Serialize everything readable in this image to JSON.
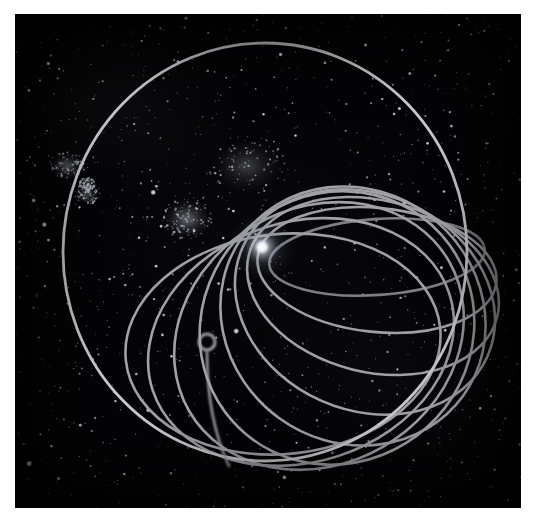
{
  "figure": {
    "caption": "",
    "kind": "astronomical-orbit-diagram",
    "plate": {
      "background_color": "#040406",
      "left": 15,
      "top": 14,
      "width": 506,
      "height": 494,
      "page_background": "#ffffff"
    }
  },
  "style": {
    "orbit_stroke_color": "#a0a2a6",
    "orbit_stroke_color_bright": "#c9cbce",
    "orbit_stroke_color_dim": "#7d7f84",
    "orbit_stroke_width": 2.6,
    "outer_orbit_stroke_width": 2.8,
    "star_core_color": "#ffffff",
    "star_glow_color": "#dfe4ef",
    "star_halo_color": "#8f98ad",
    "field_star_color": "#e8eaf0",
    "cluster_color": "#b9bec9"
  },
  "star": {
    "label": "central-star",
    "name": "Bright star (common focus)",
    "cx": 247,
    "cy": 233,
    "core_radius": 7.5,
    "glow_radius": 20,
    "halo_radius": 34
  },
  "perihelion": {
    "label": "common-perihelion-node",
    "cx": 256,
    "cy": 222,
    "note": "All ellipses of the family converge here"
  },
  "small_loop": {
    "label": "small-circular-loop",
    "cx": 192,
    "cy": 328,
    "outer_radius": 10.5,
    "inner_radius": 5.5,
    "tail_to_x": 214,
    "tail_to_y": 452
  },
  "outer_orbit": {
    "label": "outer-bounding-orbit",
    "cx": 250,
    "cy": 238,
    "rx": 202,
    "ry": 209,
    "rotation_deg": 0
  },
  "chart_data": {
    "type": "scatter",
    "xlabel": "",
    "ylabel": "",
    "grid": false,
    "legend": "none",
    "note": "Orbit family: nested ellipses all tangent/converging at the perihelion node near the star; drawn in projection so they form a fan or teardrop bundle.",
    "orbit_family": [
      {
        "name": "orbit-1",
        "rx": 108,
        "ry": 38,
        "rot": -4,
        "cx": 362,
        "cy": 243,
        "tone": "dim"
      },
      {
        "name": "orbit-2",
        "rx": 120,
        "ry": 62,
        "rot": 6,
        "cx": 362,
        "cy": 256,
        "tone": "normal"
      },
      {
        "name": "orbit-3",
        "rx": 128,
        "ry": 86,
        "rot": 14,
        "cx": 358,
        "cy": 272,
        "tone": "normal"
      },
      {
        "name": "orbit-4",
        "rx": 134,
        "ry": 108,
        "rot": 24,
        "cx": 350,
        "cy": 288,
        "tone": "normal"
      },
      {
        "name": "orbit-5",
        "rx": 136,
        "ry": 126,
        "rot": 36,
        "cx": 338,
        "cy": 302,
        "tone": "normal"
      },
      {
        "name": "orbit-6",
        "rx": 134,
        "ry": 140,
        "rot": 48,
        "cx": 322,
        "cy": 314,
        "tone": "normal"
      },
      {
        "name": "orbit-7",
        "rx": 128,
        "ry": 150,
        "rot": 60,
        "cx": 304,
        "cy": 322,
        "tone": "normal"
      },
      {
        "name": "orbit-8",
        "rx": 120,
        "ry": 156,
        "rot": 72,
        "cx": 286,
        "cy": 328,
        "tone": "normal"
      },
      {
        "name": "orbit-9",
        "rx": 110,
        "ry": 158,
        "rot": 84,
        "cx": 268,
        "cy": 330,
        "tone": "normal"
      }
    ],
    "outer_circle": {
      "name": "outer-bounding-orbit",
      "cx": 250,
      "cy": 238,
      "rx": 202,
      "ry": 209
    }
  },
  "clusters": [
    {
      "name": "cluster-upper-left-a",
      "cx": 52,
      "cy": 152,
      "rx": 16,
      "ry": 12,
      "intensity": 0.3
    },
    {
      "name": "cluster-upper-left-b",
      "cx": 72,
      "cy": 180,
      "rx": 11,
      "ry": 9,
      "intensity": 0.26
    },
    {
      "name": "cluster-left-knot",
      "cx": 72,
      "cy": 170,
      "rx": 7,
      "ry": 6,
      "intensity": 0.34
    },
    {
      "name": "cluster-central",
      "cx": 172,
      "cy": 205,
      "rx": 22,
      "ry": 18,
      "intensity": 0.42
    },
    {
      "name": "cluster-upper-middle",
      "cx": 232,
      "cy": 152,
      "rx": 34,
      "ry": 26,
      "intensity": 0.22
    }
  ],
  "field_stars_note": "Dense photographic star field across the whole plate"
}
